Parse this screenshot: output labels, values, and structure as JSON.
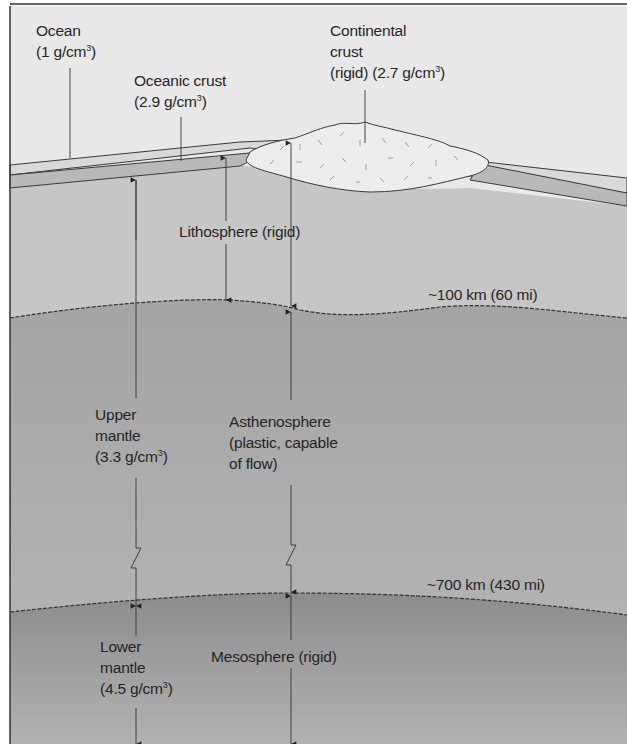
{
  "diagram": {
    "type": "earth-layer-cross-section",
    "colors": {
      "air": "#e6e6e6",
      "ocean": "#d6d6d6",
      "oceanic_crust": "#bdbdbd",
      "continental_crust": "#ececec",
      "lithosphere": "#c4c4c4",
      "asthenosphere": "#a9a9a9",
      "mesosphere": "#939393",
      "outline": "#3a3a3a"
    },
    "labels": {
      "ocean": {
        "name": "Ocean",
        "density": "(1 g/cm",
        "density_exp": "3",
        "density_close": ")"
      },
      "oceanic_crust": {
        "name": "Oceanic crust",
        "density": "(2.9 g/cm",
        "density_exp": "3",
        "density_close": ")"
      },
      "continental_crust": {
        "line1": "Continental",
        "line2": "crust",
        "line3": "(rigid)  (2.7 g/cm",
        "density_exp": "3",
        "density_close": ")"
      },
      "lithosphere": "Lithosphere (rigid)",
      "depth_100": "~100 km (60 mi)",
      "upper_mantle": {
        "line1": "Upper",
        "line2": "mantle",
        "line3": "(3.3 g/cm",
        "density_exp": "3",
        "density_close": ")"
      },
      "asthenosphere": {
        "line1": "Asthenosphere",
        "line2": "(plastic, capable",
        "line3": "of flow)"
      },
      "depth_700": "~700 km (430 mi)",
      "lower_mantle": {
        "line1": "Lower",
        "line2": "mantle",
        "line3": "(4.5 g/cm",
        "density_exp": "3",
        "density_close": ")"
      },
      "mesosphere": "Mesosphere (rigid)"
    }
  }
}
